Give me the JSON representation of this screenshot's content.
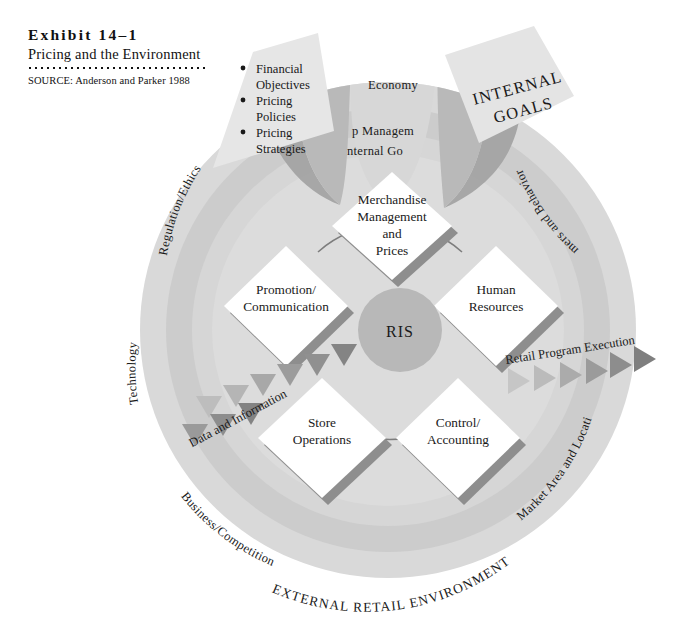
{
  "header": {
    "exhibit_number": "Exhibit 14–1",
    "title": "Pricing and the Environment",
    "source": "SOURCE:  Anderson and Parker 1988"
  },
  "diagram": {
    "outer_ring_label": "EXTERNAL RETAIL ENVIRONMENT",
    "center_label": "RIS",
    "internal_goals_label_line1": "INTERNAL",
    "internal_goals_label_line2": "GOALS",
    "top_management_line1": "p Managem",
    "top_management_line2": "nternal Go",
    "environment_labels": [
      {
        "name": "regulation-ethics",
        "text": "Regulation/Ethics"
      },
      {
        "name": "economy",
        "text": "Economy"
      },
      {
        "name": "consumers-and-behavior",
        "text": "mers and Behavior"
      },
      {
        "name": "technology",
        "text": "Technology"
      },
      {
        "name": "market-area-and-location",
        "text": "Market Area and Location"
      },
      {
        "name": "business-competition",
        "text": "Business/Competition"
      }
    ],
    "bullets": [
      "Financial",
      "Objectives",
      "Pricing",
      "Policies",
      "Pricing",
      "Strategies"
    ],
    "bullet_items": [
      {
        "line1": "Financial",
        "line2": "Objectives"
      },
      {
        "line1": "Pricing",
        "line2": "Policies"
      },
      {
        "line1": "Pricing",
        "line2": "Strategies"
      }
    ],
    "diamonds": [
      {
        "name": "merchandise-management-and-prices",
        "lines": [
          "Merchandise",
          "Management",
          "and",
          "Prices"
        ]
      },
      {
        "name": "promotion-communication",
        "lines": [
          "Promotion/",
          "Communication"
        ]
      },
      {
        "name": "human-resources",
        "lines": [
          "Human",
          "Resources"
        ]
      },
      {
        "name": "store-operations",
        "lines": [
          "Store",
          "Operations"
        ]
      },
      {
        "name": "control-accounting",
        "lines": [
          "Control/",
          "Accounting"
        ]
      }
    ],
    "flows": [
      {
        "name": "data-and-information",
        "text": "Data and Information"
      },
      {
        "name": "retail-program-execution",
        "text": "Retail Program Execution"
      }
    ],
    "colors": {
      "ring_outer": "#d8d8d8",
      "ring_mid": "#c9c9c9",
      "ring_inner": "#d2d2d2",
      "core_field": "#dcdcdc",
      "diamond_fill": "#ffffff",
      "diamond_shadow": "#8f8f8f",
      "wedge_dark": "#9a9a9a",
      "wedge_mid": "#b5b5b5",
      "ris_circle": "#b9b9b9",
      "arrow_light": "#c4c4c4",
      "arrow_dark": "#8a8a8a",
      "text": "#1a1a1a"
    }
  }
}
